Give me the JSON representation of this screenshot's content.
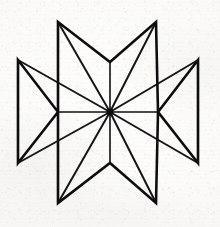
{
  "artwork": {
    "title": "Eight-Pointed Star",
    "subject": "eight-pointed star line drawing",
    "medium": "black ink line art on off-white scanned paper",
    "caption": "",
    "background_color": "#fbfaf8",
    "ink_color": "#111111",
    "paper_tone": "#f4f3f0",
    "canvas": {
      "width": 220,
      "height": 227
    },
    "center": {
      "x": 110,
      "y": 112
    },
    "ray_count": 8,
    "valley_count": 4,
    "outline_stroke_width": 2.6,
    "spoke_stroke_width": 1.5,
    "points": [
      {
        "name": "tip-top-left",
        "x": 58,
        "y": 22
      },
      {
        "name": "tip-top-right",
        "x": 156,
        "y": 22
      },
      {
        "name": "tip-left-upper",
        "x": 18,
        "y": 60
      },
      {
        "name": "tip-right-upper",
        "x": 198,
        "y": 60
      },
      {
        "name": "tip-left-lower",
        "x": 18,
        "y": 163
      },
      {
        "name": "tip-right-lower",
        "x": 198,
        "y": 163
      },
      {
        "name": "tip-bottom-left",
        "x": 58,
        "y": 203
      },
      {
        "name": "tip-bottom-right",
        "x": 156,
        "y": 203
      }
    ],
    "valleys": [
      {
        "name": "valley-top",
        "x": 110,
        "y": 62
      },
      {
        "name": "valley-left",
        "x": 58,
        "y": 112
      },
      {
        "name": "valley-right",
        "x": 158,
        "y": 112
      },
      {
        "name": "valley-bottom",
        "x": 110,
        "y": 163
      }
    ],
    "outline_path": "M 58,22 L 110,62 L 156,22 L 158,112 L 198,60 L 198,163 L 158,112 L 156,203 L 110,163 L 58,203 L 58,112 L 18,163 L 18,60 L 58,112 Z",
    "spokes": [
      {
        "name": "spoke-to-tip-top-left",
        "x": 58,
        "y": 22
      },
      {
        "name": "spoke-to-tip-top-right",
        "x": 156,
        "y": 22
      },
      {
        "name": "spoke-to-tip-left-upper",
        "x": 18,
        "y": 60
      },
      {
        "name": "spoke-to-tip-right-upper",
        "x": 198,
        "y": 60
      },
      {
        "name": "spoke-to-tip-left-lower",
        "x": 18,
        "y": 163
      },
      {
        "name": "spoke-to-tip-right-lower",
        "x": 198,
        "y": 163
      },
      {
        "name": "spoke-to-tip-bottom-left",
        "x": 58,
        "y": 203
      },
      {
        "name": "spoke-to-tip-bottom-right",
        "x": 156,
        "y": 203
      },
      {
        "name": "spoke-to-valley-top",
        "x": 110,
        "y": 62
      },
      {
        "name": "spoke-to-valley-left",
        "x": 58,
        "y": 112
      },
      {
        "name": "spoke-to-valley-right",
        "x": 158,
        "y": 112
      },
      {
        "name": "spoke-to-valley-bottom",
        "x": 110,
        "y": 163
      }
    ]
  }
}
